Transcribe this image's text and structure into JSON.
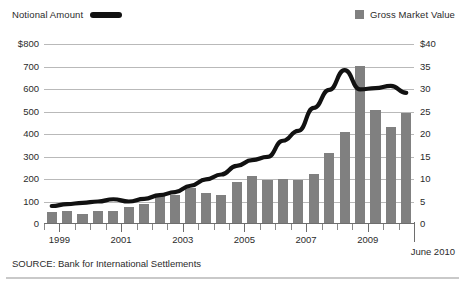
{
  "legend": {
    "notional_label": "Notional Amount",
    "gross_label": "Gross Market Value",
    "line_color": "#111111",
    "bar_color": "#808080"
  },
  "source_note": "SOURCE: Bank for International Settlements",
  "end_label": "June 2010",
  "chart_data": {
    "type": "bar",
    "title": "",
    "subtitle": "",
    "xlabel": "",
    "ylabel": "",
    "grid": true,
    "legend_position": "top",
    "x": [
      "1998 H2",
      "1999 H1",
      "1999 H2",
      "2000 H1",
      "2000 H2",
      "2001 H1",
      "2001 H2",
      "2002 H1",
      "2002 H2",
      "2003 H1",
      "2003 H2",
      "2004 H1",
      "2004 H2",
      "2005 H1",
      "2005 H2",
      "2006 H1",
      "2006 H2",
      "2007 H1",
      "2007 H2",
      "2008 H1",
      "2008 H2",
      "2009 H1",
      "2009 H2",
      "2010 H1"
    ],
    "tick_labels": [
      "1999",
      "2001",
      "2003",
      "2005",
      "2007",
      "2009"
    ],
    "tick_positions": [
      1,
      5,
      9,
      13,
      17,
      21
    ],
    "axes": [
      {
        "name": "left",
        "label": "Notional Amount",
        "unit": "$ trillions",
        "ticks": [
          "$800",
          "700",
          "600",
          "500",
          "400",
          "300",
          "200",
          "100",
          "0"
        ],
        "tick_values": [
          800,
          700,
          600,
          500,
          400,
          300,
          200,
          100,
          0
        ],
        "ylim": [
          0,
          800
        ]
      },
      {
        "name": "right",
        "label": "Gross Market Value",
        "unit": "$ trillions",
        "ticks": [
          "$40",
          "35",
          "30",
          "25",
          "20",
          "15",
          "10",
          "5",
          "0"
        ],
        "tick_values": [
          40,
          35,
          30,
          25,
          20,
          15,
          10,
          5,
          0
        ],
        "ylim": [
          0,
          40
        ]
      }
    ],
    "series": [
      {
        "name": "Gross Market Value",
        "type": "bar",
        "axis": "right",
        "color": "#808080",
        "values": [
          2.6,
          2.8,
          2.3,
          3.0,
          3.0,
          3.8,
          4.4,
          6.4,
          6.4,
          7.9,
          6.8,
          6.4,
          9.4,
          10.6,
          9.8,
          9.9,
          9.7,
          11.1,
          15.8,
          20.4,
          35.2,
          25.4,
          21.6,
          24.7
        ]
      },
      {
        "name": "Notional Amount",
        "type": "line",
        "axis": "left",
        "color": "#111111",
        "values": [
          80,
          88,
          94,
          100,
          110,
          100,
          112,
          128,
          142,
          170,
          198,
          220,
          258,
          284,
          298,
          370,
          414,
          516,
          596,
          684,
          598,
          604,
          614,
          583
        ]
      }
    ]
  }
}
